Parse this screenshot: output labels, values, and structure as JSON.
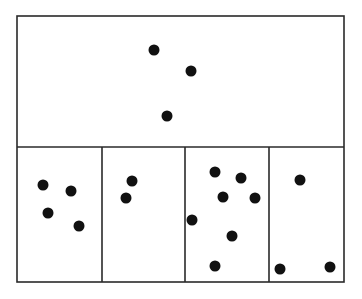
{
  "diagram": {
    "colors": {
      "stroke": "#2a2a2a",
      "dot": "#111111",
      "background": "#ffffff"
    },
    "frame": {
      "x1": 17,
      "y1": 16,
      "x2": 344,
      "y2": 282
    },
    "horizontal_divider_y": 147,
    "vertical_dividers_x": [
      102,
      185,
      269
    ],
    "dot_radius": 5.5,
    "cells": [
      {
        "name": "top-cell",
        "dot_count": 3,
        "dots": [
          [
            154,
            50
          ],
          [
            191,
            71
          ],
          [
            167,
            116
          ]
        ]
      },
      {
        "name": "bottom-cell-1",
        "dot_count": 4,
        "dots": [
          [
            43,
            185
          ],
          [
            71,
            191
          ],
          [
            48,
            213
          ],
          [
            79,
            226
          ]
        ]
      },
      {
        "name": "bottom-cell-2",
        "dot_count": 2,
        "dots": [
          [
            132,
            181
          ],
          [
            126,
            198
          ]
        ]
      },
      {
        "name": "bottom-cell-3",
        "dot_count": 7,
        "dots": [
          [
            215,
            172
          ],
          [
            241,
            178
          ],
          [
            223,
            197
          ],
          [
            255,
            198
          ],
          [
            192,
            220
          ],
          [
            232,
            236
          ],
          [
            215,
            266
          ]
        ]
      },
      {
        "name": "bottom-cell-4",
        "dot_count": 3,
        "dots": [
          [
            300,
            180
          ],
          [
            280,
            269
          ],
          [
            330,
            267
          ]
        ]
      }
    ]
  }
}
